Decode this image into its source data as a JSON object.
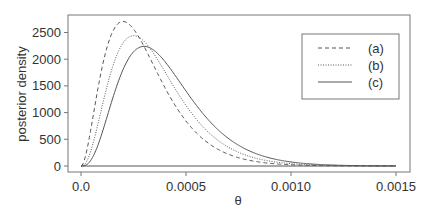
{
  "chart_data": {
    "type": "line",
    "title": "",
    "xlabel": "θ",
    "ylabel": "posterior density",
    "xlim": [
      0,
      0.0015
    ],
    "ylim": [
      0,
      2700
    ],
    "x_ticks": [
      "0.0",
      "0.0005",
      "0.0010",
      "0.0015"
    ],
    "x_tick_values": [
      0,
      0.0005,
      0.001,
      0.0015
    ],
    "y_ticks": [
      "0",
      "500",
      "1000",
      "1500",
      "2000",
      "2500"
    ],
    "y_tick_values": [
      0,
      500,
      1000,
      1500,
      2000,
      2500
    ],
    "grid": false,
    "legend_position": "top-right",
    "x": [
      0,
      5e-05,
      0.0001,
      0.00015,
      0.0002,
      0.00025,
      0.0003,
      0.0004,
      0.0005,
      0.0006,
      0.0008,
      0.001,
      0.0015
    ],
    "series": [
      {
        "name": "(a)",
        "style": "dashed",
        "values": [
          0,
          303,
          1839,
          2510,
          2707,
          2565,
          2240,
          1465,
          842,
          446,
          107,
          23,
          0
        ]
      },
      {
        "name": "(b)",
        "style": "dotted",
        "values": [
          0,
          107,
          1107,
          1850,
          2303,
          2441,
          2336,
          1763,
          1134,
          658,
          183,
          43,
          1
        ]
      },
      {
        "name": "(c)",
        "style": "solid",
        "values": [
          0,
          101,
          613,
          1255,
          1804,
          2138,
          2240,
          1954,
          1404,
          892,
          286,
          76,
          3
        ]
      }
    ]
  },
  "legend": {
    "a": "(a)",
    "b": "(b)",
    "c": "(c)"
  },
  "axes": {
    "xlabel": "θ",
    "ylabel": "posterior density"
  }
}
